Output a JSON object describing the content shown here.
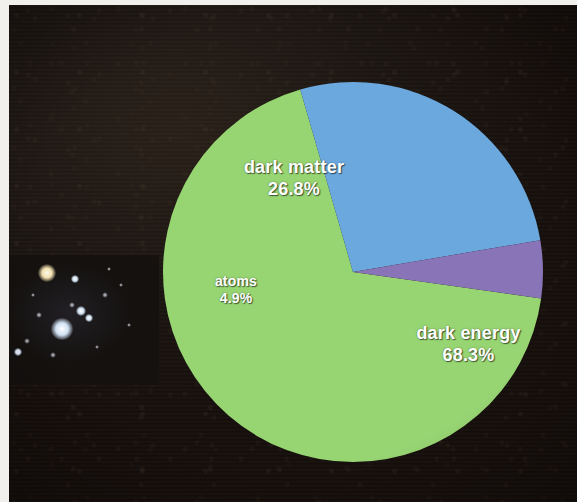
{
  "image": {
    "kind": "photographed-slide",
    "background_color": "#1a1310",
    "border_color": "#f2f0ec"
  },
  "background_photo": {
    "name": "deep-field-starfield",
    "description": "Hubble deep field galaxies",
    "galaxies": [
      {
        "x": 38,
        "y": 18,
        "r": 9,
        "type": "warm"
      },
      {
        "x": 66,
        "y": 24,
        "r": 4,
        "type": "cool"
      },
      {
        "x": 53,
        "y": 74,
        "r": 11,
        "type": "cool"
      },
      {
        "x": 72,
        "y": 56,
        "r": 5,
        "type": "cool"
      },
      {
        "x": 80,
        "y": 63,
        "r": 4,
        "type": "cool"
      },
      {
        "x": 63,
        "y": 50,
        "r": 3,
        "type": "dim"
      },
      {
        "x": 96,
        "y": 40,
        "r": 3,
        "type": "dim"
      },
      {
        "x": 112,
        "y": 30,
        "r": 2,
        "type": "dim"
      },
      {
        "x": 18,
        "y": 86,
        "r": 3,
        "type": "dim"
      },
      {
        "x": 9,
        "y": 97,
        "r": 4,
        "type": "cool"
      },
      {
        "x": 30,
        "y": 60,
        "r": 3,
        "type": "dim"
      },
      {
        "x": 44,
        "y": 100,
        "r": 3,
        "type": "dim"
      },
      {
        "x": 88,
        "y": 92,
        "r": 2,
        "type": "dim"
      },
      {
        "x": 120,
        "y": 70,
        "r": 2,
        "type": "dim"
      },
      {
        "x": 24,
        "y": 40,
        "r": 2,
        "type": "dim"
      },
      {
        "x": 100,
        "y": 14,
        "r": 2,
        "type": "dim"
      }
    ]
  },
  "chart_data": {
    "type": "pie",
    "title": "",
    "categories": [
      "dark energy",
      "dark matter",
      "atoms"
    ],
    "values": [
      68.3,
      26.8,
      4.9
    ],
    "value_labels": [
      "68.3%",
      "26.8%",
      "4.9%"
    ],
    "colors": [
      "#97d472",
      "#6ba8dd",
      "#8a74b8"
    ],
    "units": "percent",
    "total": 100.0,
    "legend": "none (labels drawn inside slices)",
    "start_angle_deg": 8,
    "direction": "clockwise",
    "slices": [
      {
        "name": "dark-energy-slice",
        "label": "dark energy",
        "value": 68.3,
        "value_label": "68.3%",
        "color": "#97d472"
      },
      {
        "name": "dark-matter-slice",
        "label": "dark matter",
        "value": 26.8,
        "value_label": "26.8%",
        "color": "#6ba8dd"
      },
      {
        "name": "atoms-slice",
        "label": "atoms",
        "value": 4.9,
        "value_label": "4.9%",
        "color": "#8a74b8"
      }
    ]
  },
  "geometry": {
    "center_x": 353,
    "center_y": 272,
    "radius": 190
  }
}
